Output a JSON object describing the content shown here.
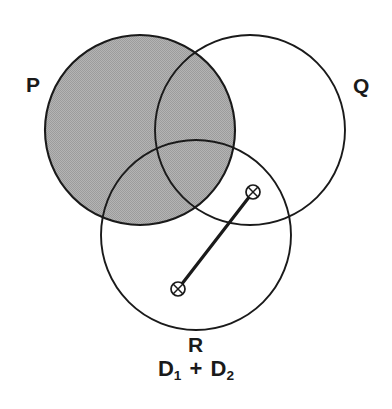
{
  "figure": {
    "type": "venn-diagram",
    "background_color": "#ffffff",
    "stroke_color": "#1a1a1a",
    "shade_color": "#a9a9a9",
    "caption": "D1 + D2"
  },
  "sets": [
    {
      "id": "P",
      "label": "P",
      "label_x": 34,
      "label_y": 85,
      "center_x": 140,
      "center_y": 130,
      "radius": 95,
      "shaded": true,
      "fill": "#a9a9a9"
    },
    {
      "id": "Q",
      "label": "Q",
      "label_x": 362,
      "label_y": 86,
      "center_x": 250,
      "center_y": 130,
      "radius": 95,
      "shaded": false,
      "fill": "#ffffff"
    },
    {
      "id": "R",
      "label": "R",
      "label_x": 196,
      "label_y": 345,
      "center_x": 196,
      "center_y": 235,
      "radius": 95,
      "shaded": false,
      "fill": "#ffffff"
    }
  ],
  "markers": [
    {
      "id": "marker-upper",
      "glyph": "circle-x",
      "x": 253,
      "y": 192,
      "radius": 7
    },
    {
      "id": "marker-lower",
      "glyph": "circle-x",
      "x": 178,
      "y": 289,
      "radius": 7
    }
  ],
  "connector": {
    "id": "distance-connector",
    "x1": 178,
    "y1": 289,
    "x2": 253,
    "y2": 192,
    "width": 3.2,
    "color": "#1a1a1a"
  },
  "formula": {
    "full_text": "D1 + D2",
    "terms": [
      {
        "base": "D",
        "sub": "1"
      },
      {
        "base": "D",
        "sub": "2"
      }
    ],
    "operator": "+"
  }
}
